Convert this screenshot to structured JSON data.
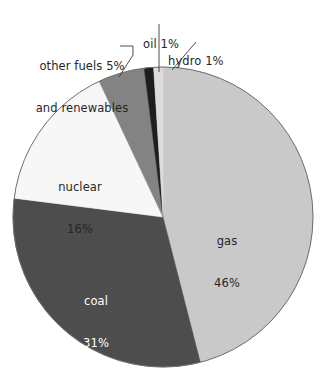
{
  "chart_data": {
    "type": "pie",
    "title": "",
    "subtitle": "",
    "xlabel": "",
    "ylabel": "",
    "legend_position": "none",
    "grid": false,
    "units": "percent",
    "start_angle_deg": 0,
    "direction": "clockwise",
    "categories": [
      "gas",
      "coal",
      "nuclear",
      "other fuels and renewables",
      "oil",
      "hydro"
    ],
    "values": [
      46,
      31,
      16,
      5,
      1,
      1
    ],
    "slices": [
      {
        "id": "gas",
        "name": "gas",
        "value": 46,
        "value_label": "46%",
        "label_line1": "gas",
        "label_line2": "46%",
        "color": "#c9c9c9",
        "label_placement": "inside",
        "label_text_color": "#262626",
        "start_deg": 0,
        "sweep_deg": 165.6
      },
      {
        "id": "coal",
        "name": "coal",
        "value": 31,
        "value_label": "31%",
        "label_line1": "coal",
        "label_line2": "31%",
        "color": "#4d4d4d",
        "label_placement": "inside",
        "label_text_color": "#ffffff",
        "start_deg": 165.6,
        "sweep_deg": 111.6
      },
      {
        "id": "nuclear",
        "name": "nuclear",
        "value": 16,
        "value_label": "16%",
        "label_line1": "nuclear",
        "label_line2": "16%",
        "color": "#f7f7f7",
        "label_placement": "inside",
        "label_text_color": "#262626",
        "start_deg": 277.2,
        "sweep_deg": 57.6
      },
      {
        "id": "other-fuels",
        "name": "other fuels and renewables",
        "value": 5,
        "value_label": "5%",
        "label_line1": "other fuels 5%",
        "label_line2": "and renewables",
        "color": "#838383",
        "label_placement": "callout",
        "label_text_color": "#262626",
        "start_deg": 334.8,
        "sweep_deg": 18
      },
      {
        "id": "oil",
        "name": "oil",
        "value": 1,
        "value_label": "1%",
        "label_line1": "oil 1%",
        "label_line2": "",
        "color": "#1e1e1e",
        "label_placement": "callout",
        "label_text_color": "#262626",
        "start_deg": 352.8,
        "sweep_deg": 3.6
      },
      {
        "id": "hydro",
        "name": "hydro",
        "value": 1,
        "value_label": "1%",
        "label_line1": "hydro 1%",
        "label_line2": "",
        "color": "#dcdcdc",
        "label_placement": "callout",
        "label_text_color": "#262626",
        "start_deg": 356.4,
        "sweep_deg": 3.6
      }
    ]
  },
  "figure": {
    "background_color": "#ffffff",
    "outline_color": "#6e6e6e",
    "leader_line_color": "#3a3a3a",
    "center_x": 163,
    "center_y": 217,
    "radius": 150
  },
  "labels": {
    "oil": {
      "line1": "oil 1%",
      "line2": ""
    },
    "hydro": {
      "line1": "hydro 1%",
      "line2": ""
    },
    "other_fuels": {
      "line1": "other fuels 5%",
      "line2": "and renewables"
    },
    "nuclear": {
      "line1": "nuclear",
      "line2": "16%"
    },
    "coal": {
      "line1": "coal",
      "line2": "31%"
    },
    "gas": {
      "line1": "gas",
      "line2": "46%"
    }
  }
}
